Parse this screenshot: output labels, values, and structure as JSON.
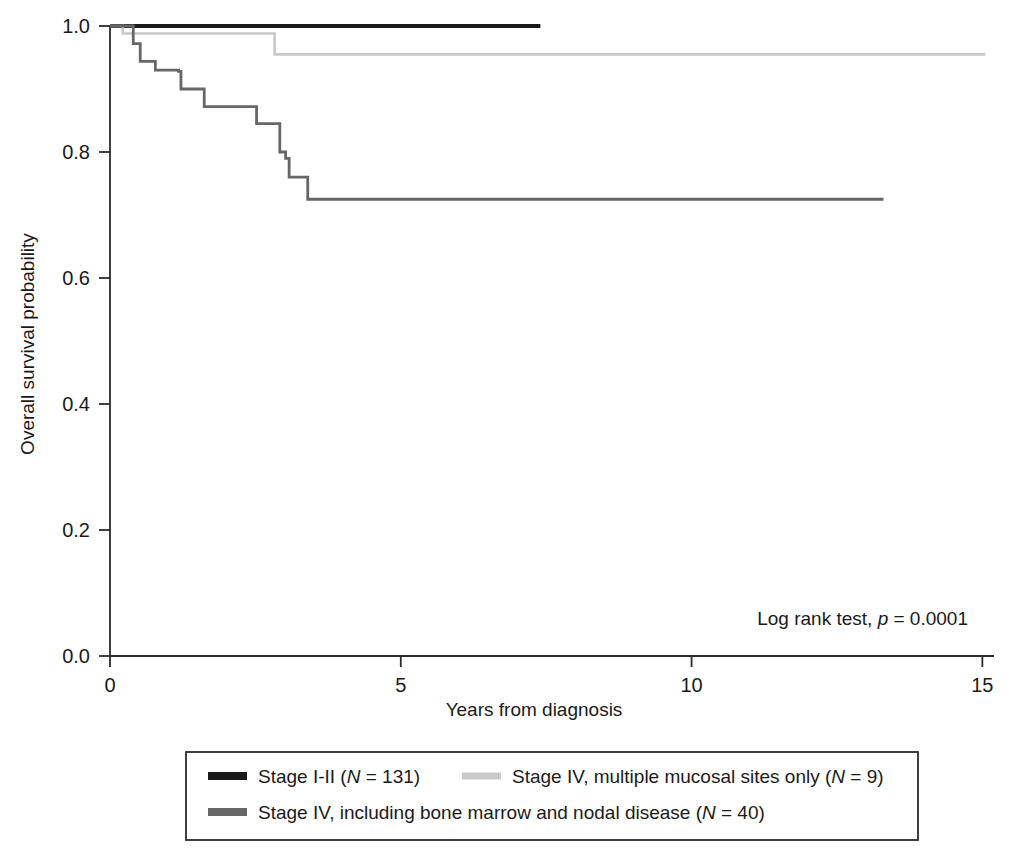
{
  "chart_data": {
    "type": "line",
    "subtype": "kaplan-meier-step",
    "title": "",
    "xlabel": "Years from diagnosis",
    "ylabel": "Overall survival probability",
    "xlim": [
      0,
      15.2
    ],
    "ylim": [
      0,
      1.0
    ],
    "xticks": [
      0,
      5,
      10,
      15
    ],
    "xticklabels": [
      "0",
      "5",
      "10",
      "15"
    ],
    "yticks": [
      0.0,
      0.2,
      0.4,
      0.6,
      0.8,
      1.0
    ],
    "yticklabels": [
      "0.0",
      "0.2",
      "0.4",
      "0.6",
      "0.8",
      "1.0"
    ],
    "grid": false,
    "legend_position": "below-plot",
    "annotations": [
      {
        "name": "log-rank-annotation",
        "text_parts": [
          {
            "text": "Log rank test, ",
            "style": "normal"
          },
          {
            "text": "p",
            "style": "italic"
          },
          {
            "text": " = 0.0001",
            "style": "normal"
          }
        ],
        "plain": "Log rank test, p = 0.0001",
        "x": 10.6,
        "y": 0.055
      }
    ],
    "series": [
      {
        "name": "Stage I-II",
        "label_parts": [
          {
            "text": "Stage I-II (",
            "style": "normal"
          },
          {
            "text": "N",
            "style": "italic"
          },
          {
            "text": " = 131)",
            "style": "normal"
          }
        ],
        "plain_label": "Stage I-II (N = 131)",
        "n": 131,
        "color": "#1a1a1a",
        "linewidth": 4.2,
        "points": [
          [
            0.0,
            1.0
          ],
          [
            7.4,
            1.0
          ]
        ]
      },
      {
        "name": "Stage IV, multiple mucosal sites only",
        "label_parts": [
          {
            "text": "Stage IV, multiple mucosal sites only (",
            "style": "normal"
          },
          {
            "text": "N",
            "style": "italic"
          },
          {
            "text": " = 9)",
            "style": "normal"
          }
        ],
        "plain_label": "Stage IV, multiple mucosal sites only (N = 9)",
        "n": 9,
        "color": "#c9c9c9",
        "linewidth": 2.6,
        "points": [
          [
            0.0,
            1.0
          ],
          [
            0.22,
            1.0
          ],
          [
            0.22,
            0.988
          ],
          [
            2.83,
            0.988
          ],
          [
            2.83,
            0.955
          ],
          [
            15.05,
            0.955
          ]
        ]
      },
      {
        "name": "Stage IV, including bone marrow and nodal disease",
        "label_parts": [
          {
            "text": "Stage IV, including bone marrow and nodal disease (",
            "style": "normal"
          },
          {
            "text": "N",
            "style": "italic"
          },
          {
            "text": " = 40)",
            "style": "normal"
          }
        ],
        "plain_label": "Stage IV, including bone marrow and nodal disease (N = 40)",
        "n": 40,
        "color": "#676767",
        "linewidth": 2.8,
        "points": [
          [
            0.0,
            1.0
          ],
          [
            0.4,
            1.0
          ],
          [
            0.4,
            0.972
          ],
          [
            0.52,
            0.972
          ],
          [
            0.52,
            0.944
          ],
          [
            0.78,
            0.944
          ],
          [
            0.78,
            0.93
          ],
          [
            1.18,
            0.93
          ],
          [
            1.18,
            0.928
          ],
          [
            1.22,
            0.928
          ],
          [
            1.22,
            0.9
          ],
          [
            1.62,
            0.9
          ],
          [
            1.62,
            0.872
          ],
          [
            2.52,
            0.872
          ],
          [
            2.52,
            0.845
          ],
          [
            2.92,
            0.845
          ],
          [
            2.92,
            0.8
          ],
          [
            3.02,
            0.8
          ],
          [
            3.02,
            0.79
          ],
          [
            3.08,
            0.79
          ],
          [
            3.08,
            0.76
          ],
          [
            3.4,
            0.76
          ],
          [
            3.4,
            0.725
          ],
          [
            13.3,
            0.725
          ]
        ]
      }
    ]
  },
  "legend": {
    "entries": [
      {
        "label_ref": "series.0"
      },
      {
        "label_ref": "series.1"
      },
      {
        "label_ref": "series.2"
      }
    ]
  }
}
